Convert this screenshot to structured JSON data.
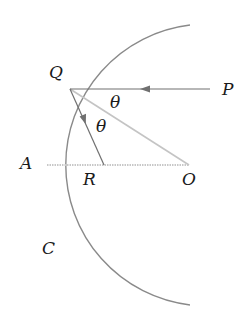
{
  "diagram": {
    "type": "geometry-optics",
    "colors": {
      "arc": "#8a8a8a",
      "ray": "#707070",
      "normal": "#c4c4c4",
      "axis": "#c8c8c8",
      "text": "#1a1a1a"
    },
    "points": {
      "Q": {
        "x": 70,
        "y": 89
      },
      "P": {
        "x": 210,
        "y": 89
      },
      "A": {
        "x": 46,
        "y": 165
      },
      "R": {
        "x": 104,
        "y": 165
      },
      "O": {
        "x": 188,
        "y": 165
      }
    },
    "labels": {
      "Q": "Q",
      "P": "P",
      "A": "A",
      "R": "R",
      "O": "O",
      "C": "C",
      "theta1": "θ",
      "theta2": "θ"
    }
  }
}
